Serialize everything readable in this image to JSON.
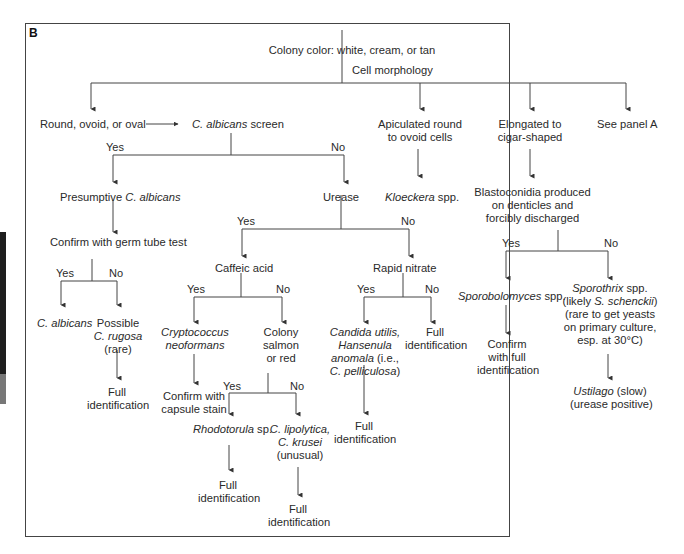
{
  "panel_label": "B",
  "root": "Colony color: white, cream, or tan",
  "cell_morphology": "Cell morphology",
  "branches": {
    "round": "Round, ovoid, or oval",
    "apiculated": [
      "Apiculated round",
      "to ovoid cells"
    ],
    "elongated": [
      "Elongated to",
      "cigar-shaped"
    ],
    "see_panel_a": "See panel A"
  },
  "screen": {
    "italic": "C. albicans",
    "rest": " screen"
  },
  "yes": "Yes",
  "no": "No",
  "presumptive": {
    "plain": "Presumptive ",
    "italic": "C. albicans"
  },
  "germ_tube": "Confirm with germ tube test",
  "c_albicans": "C. albicans",
  "possible": "Possible",
  "c_rugosa": "C. rugosa",
  "rare": "(rare)",
  "full": "Full",
  "identification": "identification",
  "urease": "Urease",
  "kloeckera": {
    "italic": "Kloeckera",
    "rest": " spp."
  },
  "blastoconidia": [
    "Blastoconidia produced",
    "on denticles and",
    "forcibly discharged"
  ],
  "caffeic": "Caffeic acid",
  "rapid_nitrate": "Rapid nitrate",
  "cryptococcus": [
    "Cryptococcus",
    "neoformans"
  ],
  "colony_salmon": [
    "Colony",
    "salmon",
    "or red"
  ],
  "capsule": [
    "Confirm with",
    "capsule stain"
  ],
  "candida_utilis": [
    "Candida utilis,",
    "Hansenula",
    "anomala",
    " (i.e.,",
    "C. pelliculosa",
    ")"
  ],
  "rhodotorula": {
    "italic": "Rhodotorula",
    "rest": " sp."
  },
  "lipolytica": [
    "C. lipolytica,",
    "C. krusei",
    "(unusual)"
  ],
  "sporobolomyces": {
    "italic": "Sporobolomyces",
    "rest": " spp."
  },
  "confirm_full": [
    "Confirm",
    "with full",
    "identification"
  ],
  "sporothrix": {
    "italic": "Sporothrix",
    "rest": " spp.",
    "likely": "(likely ",
    "schenckii": "S. schenckii",
    "close": ")",
    "l3": "(rare to get yeasts",
    "l4": "on primary culture,",
    "l5": "esp. at 30°C)"
  },
  "ustilago": {
    "italic": "Ustilago",
    "rest": " (slow)",
    "l2": "(urease positive)"
  }
}
